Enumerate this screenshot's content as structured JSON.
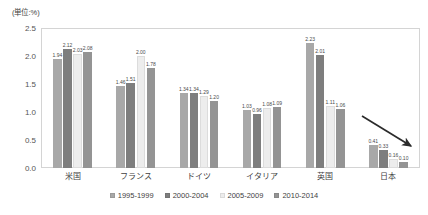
{
  "unit_note": "(単位:%)",
  "chart_data": {
    "type": "bar",
    "title": "",
    "subtitle": "",
    "xlabel": "",
    "ylabel": "",
    "unit_note": "(単位:%)",
    "ylim": [
      0,
      2.5
    ],
    "ytick_labels": [
      "0.0",
      "0.5",
      "1.0",
      "1.5",
      "2.0",
      "2.5"
    ],
    "ytick_values": [
      0,
      0.5,
      1.0,
      1.5,
      2.0,
      2.5
    ],
    "grid": false,
    "legend_position": "bottom",
    "categories": [
      "米国",
      "フランス",
      "ドイツ",
      "イタリア",
      "英国",
      "日本"
    ],
    "series": [
      {
        "name": "1995-1999",
        "color": "#a8a8a8",
        "values": [
          1.94,
          1.46,
          1.34,
          1.03,
          2.23,
          0.41
        ]
      },
      {
        "name": "2000-2004",
        "color": "#7e7e7e",
        "values": [
          2.12,
          1.51,
          1.34,
          0.96,
          2.01,
          0.33
        ]
      },
      {
        "name": "2005-2009",
        "color": "#ededed",
        "values": [
          2.03,
          2.0,
          1.29,
          1.08,
          1.11,
          0.16
        ]
      },
      {
        "name": "2010-2014",
        "color": "#949494",
        "values": [
          2.08,
          1.78,
          1.2,
          1.09,
          1.06,
          0.1
        ]
      }
    ],
    "value_labels": [
      [
        "1.94",
        "2.12",
        "2.03",
        "2.08"
      ],
      [
        "1.46",
        "1.51",
        "2.00",
        "1.78"
      ],
      [
        "1.34",
        "1.34",
        "1.29",
        "1.20"
      ],
      [
        "1.03",
        "0.96",
        "1.08",
        "1.09"
      ],
      [
        "2.23",
        "2.01",
        "1.11",
        "1.06"
      ],
      [
        "0.41",
        "0.33",
        "0.16",
        "0.10"
      ]
    ],
    "annotations": [
      {
        "type": "arrow",
        "name": "declining-trend-arrow",
        "target_category": "日本"
      }
    ]
  }
}
